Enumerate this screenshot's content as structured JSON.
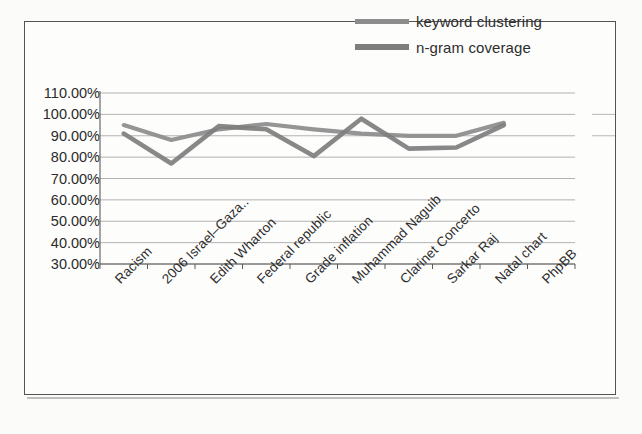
{
  "legend": {
    "position": "top-right",
    "items": [
      {
        "label": "keyword clustering",
        "color": "#8c8c8c",
        "icon": "line-swatch-icon"
      },
      {
        "label": "n-gram coverage",
        "color": "#7e7e7e",
        "icon": "line-swatch-icon"
      }
    ]
  },
  "axes": {
    "y_ticks": [
      "110.00%",
      "100.00%",
      "90.00%",
      "80.00%",
      "70.00%",
      "60.00%",
      "50.00%",
      "40.00%",
      "30.00%"
    ],
    "x_ticks": [
      "Racism",
      "2006 Israel–Gaza..",
      "Edith Wharton",
      "Federal republic",
      "Grade inflation",
      "Muhammad Naguib",
      "Clarinet Concerto",
      "Sarkar Raj",
      "Natal chart",
      "PhpBB"
    ]
  },
  "chart_data": {
    "type": "line",
    "title": "",
    "xlabel": "",
    "ylabel": "",
    "ylim": [
      30,
      110
    ],
    "ytick_step": 10,
    "ytick_format": "percent",
    "grid": true,
    "legend_position": "top-right",
    "categories": [
      "Racism",
      "2006 Israel–Gaza..",
      "Edith Wharton",
      "Federal republic",
      "Grade inflation",
      "Muhammad Naguib",
      "Clarinet Concerto",
      "Sarkar Raj",
      "Natal chart",
      "PhpBB"
    ],
    "series": [
      {
        "name": "keyword clustering",
        "color": "#8c8c8c",
        "values": [
          95.0,
          88.0,
          93.0,
          95.5,
          93.0,
          91.0,
          90.0,
          90.0,
          96.0,
          null
        ]
      },
      {
        "name": "n-gram coverage",
        "color": "#7e7e7e",
        "values": [
          91.0,
          77.0,
          94.5,
          93.0,
          80.5,
          98.0,
          84.0,
          84.5,
          95.0,
          null
        ]
      }
    ]
  }
}
